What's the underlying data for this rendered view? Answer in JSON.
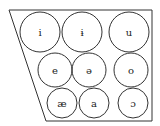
{
  "diagram": {
    "type": "vowel-chart",
    "outline_color": "#333333",
    "outline": [
      [
        9,
        10
      ],
      [
        152,
        10
      ],
      [
        152,
        121
      ],
      [
        46,
        121
      ]
    ],
    "vowels": [
      {
        "symbol": "i",
        "cx": 40,
        "cy": 32,
        "r": 20
      },
      {
        "symbol": "ɨ",
        "cx": 82,
        "cy": 32,
        "r": 20
      },
      {
        "symbol": "u",
        "cx": 129,
        "cy": 32,
        "r": 20
      },
      {
        "symbol": "e",
        "cx": 55,
        "cy": 70,
        "r": 17
      },
      {
        "symbol": "ə",
        "cx": 89,
        "cy": 70,
        "r": 17
      },
      {
        "symbol": "o",
        "cx": 131,
        "cy": 70,
        "r": 17
      },
      {
        "symbol": "æ",
        "cx": 62,
        "cy": 103,
        "r": 15
      },
      {
        "symbol": "a",
        "cx": 94,
        "cy": 103,
        "r": 15
      },
      {
        "symbol": "ɔ",
        "cx": 133,
        "cy": 103,
        "r": 15
      }
    ]
  }
}
